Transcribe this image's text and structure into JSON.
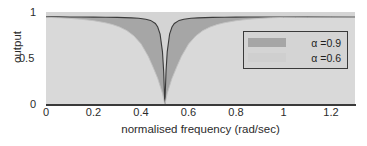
{
  "chart_data": {
    "type": "area",
    "title": "",
    "xlabel": "normalised frequency (rad/sec)",
    "ylabel": "output",
    "xlim": [
      0,
      1.3
    ],
    "ylim": [
      0,
      1.05
    ],
    "xticks": [
      "0",
      "0.2",
      "0.4",
      "0.6",
      "0.8",
      "1",
      "1.2"
    ],
    "xtick_values": [
      0,
      0.2,
      0.4,
      0.6,
      0.8,
      1,
      1.2
    ],
    "yticks": [
      "0",
      "0.5",
      "1"
    ],
    "ytick_values": [
      0,
      0.5,
      1
    ],
    "grid": false,
    "legend_position": "upper right",
    "notch_frequency": 0.5,
    "series": [
      {
        "name": "alpha-0.9",
        "legend_label": "α =0.9",
        "color": "#a6a6a6",
        "line_color": "#3a3a3a",
        "alpha": 0.9,
        "x": [
          0,
          0.05,
          0.1,
          0.15,
          0.2,
          0.25,
          0.3,
          0.33,
          0.36,
          0.39,
          0.42,
          0.44,
          0.46,
          0.47,
          0.48,
          0.49,
          0.495,
          0.5,
          0.505,
          0.51,
          0.52,
          0.53,
          0.54,
          0.56,
          0.58,
          0.61,
          0.64,
          0.67,
          0.7,
          0.75,
          0.8,
          0.85,
          0.9,
          0.95,
          1.0,
          1.1,
          1.2,
          1.3
        ],
        "y": [
          0.995,
          0.995,
          0.994,
          0.993,
          0.992,
          0.991,
          0.989,
          0.987,
          0.984,
          0.979,
          0.968,
          0.955,
          0.92,
          0.88,
          0.8,
          0.6,
          0.38,
          0.0,
          0.38,
          0.6,
          0.8,
          0.88,
          0.92,
          0.955,
          0.968,
          0.979,
          0.984,
          0.987,
          0.989,
          0.991,
          0.992,
          0.993,
          0.993,
          0.994,
          0.994,
          0.995,
          0.995,
          0.995
        ]
      },
      {
        "name": "alpha-0.6",
        "legend_label": "α =0.6",
        "color": "#d4d4d4",
        "line_color": "#c9c9c9",
        "alpha": 0.6,
        "x": [
          0,
          0.05,
          0.1,
          0.15,
          0.2,
          0.25,
          0.28,
          0.31,
          0.34,
          0.37,
          0.4,
          0.43,
          0.45,
          0.47,
          0.49,
          0.5,
          0.51,
          0.53,
          0.55,
          0.57,
          0.6,
          0.63,
          0.66,
          0.69,
          0.72,
          0.75,
          0.8,
          0.85,
          0.9,
          0.95,
          1.0,
          1.05,
          1.1,
          1.2,
          1.3
        ],
        "y": [
          0.99,
          0.985,
          0.978,
          0.967,
          0.952,
          0.928,
          0.908,
          0.88,
          0.84,
          0.78,
          0.69,
          0.55,
          0.43,
          0.3,
          0.13,
          0.0,
          0.13,
          0.3,
          0.43,
          0.55,
          0.69,
          0.78,
          0.84,
          0.88,
          0.908,
          0.928,
          0.952,
          0.967,
          0.978,
          0.985,
          0.989,
          0.991,
          0.992,
          0.994,
          0.995
        ]
      }
    ]
  },
  "legend": {
    "items": [
      {
        "label": "α =0.9",
        "swatch_color": "#a6a6a6"
      },
      {
        "label": "α =0.6",
        "swatch_color": "#cfcfcf"
      }
    ]
  },
  "axes": {
    "x_title": "normalised frequency (rad/sec)",
    "y_title": "output",
    "x_tick_labels": [
      "0",
      "0.2",
      "0.4",
      "0.6",
      "0.8",
      "1",
      "1.2"
    ],
    "y_tick_labels": [
      "1",
      "0.5",
      "0"
    ]
  },
  "colors": {
    "background": "#ffffff",
    "plot_background": "#d4d4d4",
    "fill_dark": "#a6a6a6",
    "fill_light": "#d4d4d4",
    "curve_line": "#3a3a3a",
    "axis": "#3a3a3a",
    "text": "#2b2b2b"
  }
}
